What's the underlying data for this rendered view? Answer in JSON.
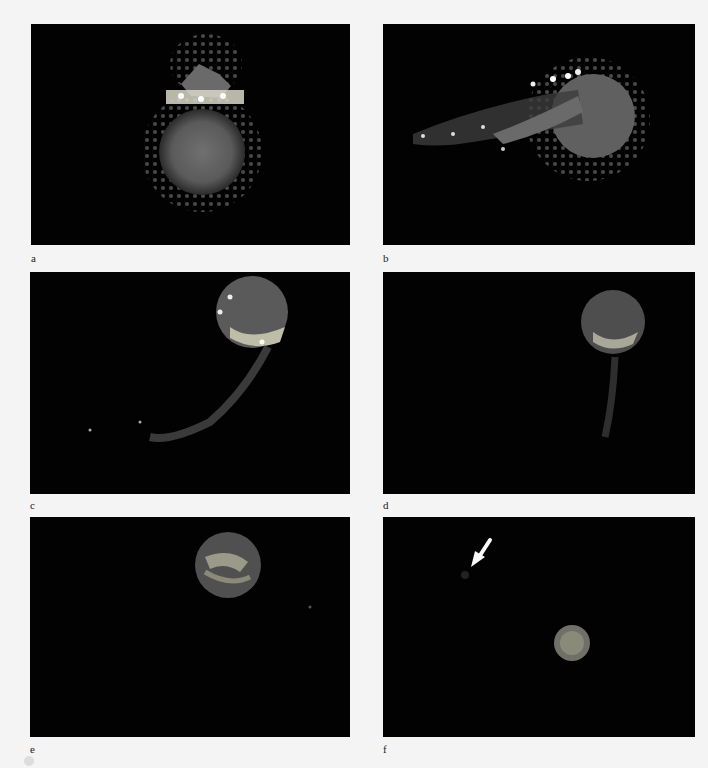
{
  "figure": {
    "panels": [
      {
        "id": "a",
        "label": "a"
      },
      {
        "id": "b",
        "label": "b"
      },
      {
        "id": "c",
        "label": "c"
      },
      {
        "id": "d",
        "label": "d"
      },
      {
        "id": "e",
        "label": "e"
      },
      {
        "id": "f",
        "label": "f"
      }
    ],
    "annotation": {
      "panel": "f",
      "type": "arrow-icon",
      "color": "#ffffff"
    },
    "colors": {
      "background": "#020202",
      "page": "#f4f4f4",
      "cell_body": "#6e6e6e",
      "bright_spots": "#f0f0e0"
    }
  }
}
